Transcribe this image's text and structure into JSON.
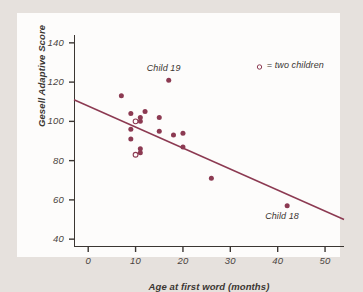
{
  "chart_data": {
    "type": "scatter",
    "title": "",
    "xlabel": "Age at first word (months)",
    "ylabel": "Gesell Adaptive Score",
    "xlim": [
      -3,
      54
    ],
    "ylim": [
      36,
      144
    ],
    "xticks": [
      0,
      10,
      20,
      30,
      40,
      50
    ],
    "yticks": [
      40,
      60,
      80,
      100,
      120,
      140
    ],
    "grid": false,
    "legend_position": "top-right",
    "series": [
      {
        "name": "children",
        "marker": "filled-circle",
        "color": "#8c3a52",
        "points": [
          {
            "x": 7,
            "y": 113
          },
          {
            "x": 9,
            "y": 104
          },
          {
            "x": 9,
            "y": 96
          },
          {
            "x": 9,
            "y": 91
          },
          {
            "x": 11,
            "y": 100
          },
          {
            "x": 11,
            "y": 102
          },
          {
            "x": 12,
            "y": 105
          },
          {
            "x": 11,
            "y": 86
          },
          {
            "x": 11,
            "y": 84
          },
          {
            "x": 15,
            "y": 102
          },
          {
            "x": 15,
            "y": 95
          },
          {
            "x": 17,
            "y": 121,
            "label": "Child 19"
          },
          {
            "x": 18,
            "y": 93
          },
          {
            "x": 20,
            "y": 94
          },
          {
            "x": 20,
            "y": 87
          },
          {
            "x": 26,
            "y": 71
          },
          {
            "x": 42,
            "y": 57,
            "label": "Child 18"
          }
        ]
      },
      {
        "name": "two children (overlapping)",
        "marker": "open-circle",
        "color": "#8c3a52",
        "points": [
          {
            "x": 10,
            "y": 100
          },
          {
            "x": 10,
            "y": 83
          }
        ]
      }
    ],
    "trendline": {
      "name": "least-squares regression line",
      "color": "#8c3a52",
      "x_start": -3,
      "y_start": 111,
      "x_end": 54,
      "y_end": 50
    },
    "annotations": [
      {
        "text": "Child 19",
        "x": 17,
        "y": 126
      },
      {
        "text": "Child 18",
        "x": 42,
        "y": 51
      }
    ],
    "legend": {
      "marker": "open-circle",
      "text": "= two children"
    }
  }
}
